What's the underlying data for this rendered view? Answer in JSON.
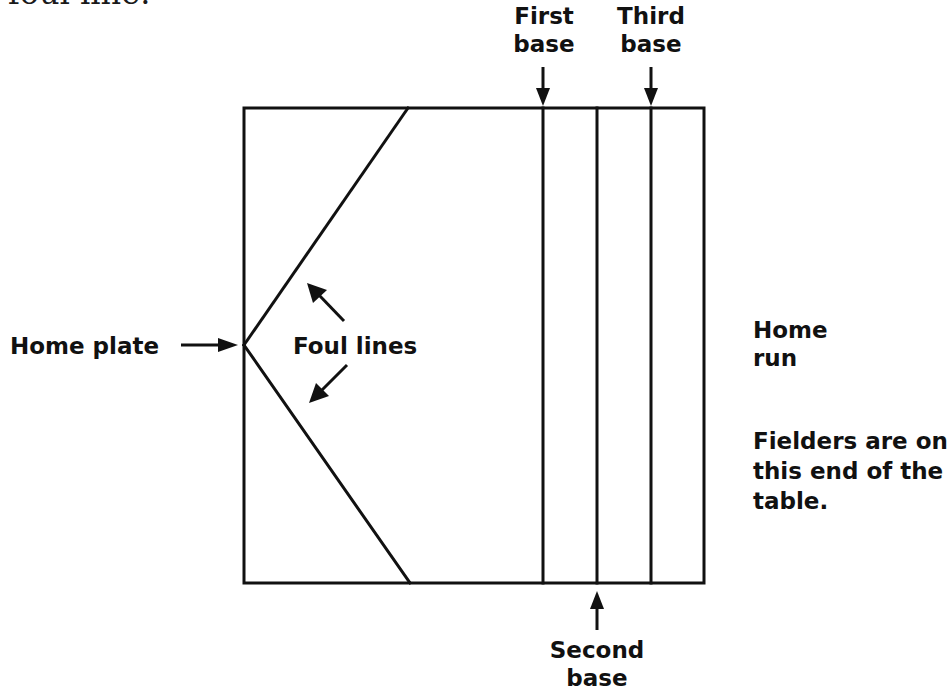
{
  "caption_fragment": "foul line.",
  "diagram": {
    "labels": {
      "first_base_line1": "First",
      "first_base_line2": "base",
      "third_base_line1": "Third",
      "third_base_line2": "base",
      "second_base_line1": "Second",
      "second_base_line2": "base",
      "home_plate": "Home plate",
      "foul_lines": "Foul lines",
      "home_run_line1": "Home",
      "home_run_line2": "run",
      "fielders_line1": "Fielders are on",
      "fielders_line2": "this end of the",
      "fielders_line3": "table."
    },
    "colors": {
      "line": "#111111",
      "background": "#ffffff"
    }
  }
}
